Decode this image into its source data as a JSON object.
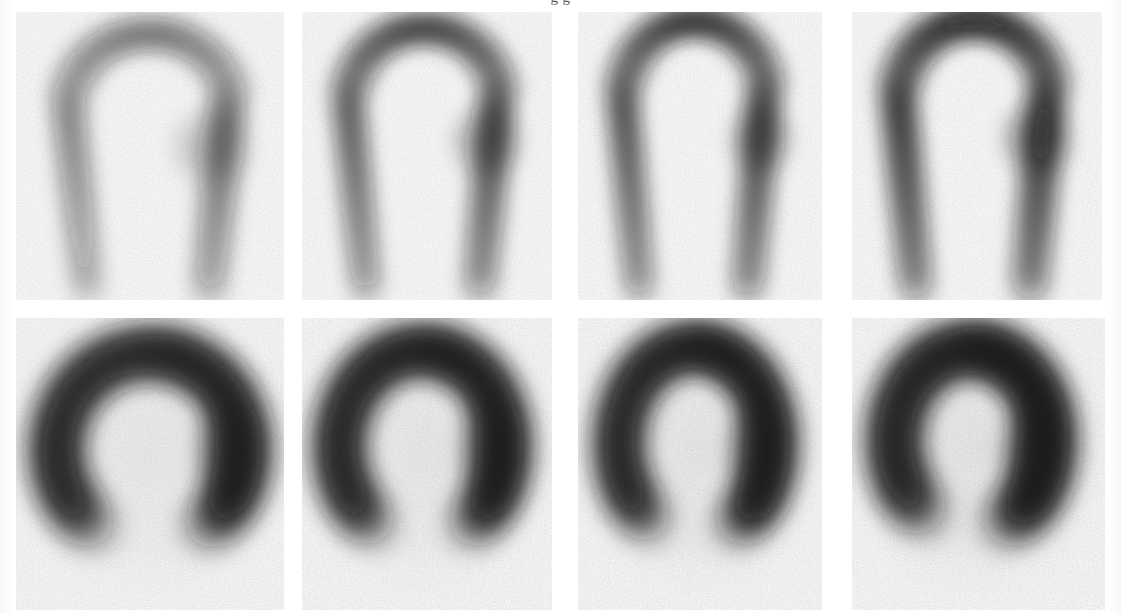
{
  "figure": {
    "domain": "medical-nuclear-imaging",
    "modality": "SPECT myocardial perfusion scintigraphy",
    "background_color": "#ffffff",
    "ink_color": "#1c1c1c",
    "clipped_caption_above_crop": "g g",
    "width": 1121,
    "height": 613,
    "rows": 2,
    "columns": 4,
    "row_labels": [
      "vertical-long-axis",
      "short-axis"
    ],
    "panels": [
      {
        "id": "panel-r1c1",
        "row": 0,
        "col": 0,
        "view": "vertical-long-axis",
        "shape": "inverted-v",
        "intensity": "faint",
        "peak_darkness": 0.42,
        "x": 16,
        "y": 12,
        "w": 268,
        "h": 288,
        "cx": 0.5,
        "cy": 0.42,
        "arc_rx": 0.205,
        "arc_ry": 0.315,
        "wall_thickness": 0.105,
        "apex_lift": 0.1,
        "tilt": -4,
        "left_wall_gain": 0.8,
        "right_wall_gain": 1.0,
        "apex_gain": 0.92,
        "base_blob": {
          "cx": 0.73,
          "cy": 0.47,
          "r": 0.17,
          "gain": 0.55
        },
        "blur": 7.0,
        "noise": 0.3
      },
      {
        "id": "panel-r1c2",
        "row": 0,
        "col": 1,
        "view": "vertical-long-axis",
        "shape": "inverted-v",
        "intensity": "moderate",
        "peak_darkness": 0.58,
        "x": 302,
        "y": 12,
        "w": 250,
        "h": 288,
        "cx": 0.49,
        "cy": 0.41,
        "arc_rx": 0.205,
        "arc_ry": 0.32,
        "wall_thickness": 0.11,
        "apex_lift": 0.11,
        "tilt": -3,
        "left_wall_gain": 0.86,
        "right_wall_gain": 1.0,
        "apex_gain": 1.0,
        "base_blob": {
          "cx": 0.74,
          "cy": 0.45,
          "r": 0.16,
          "gain": 0.62
        },
        "blur": 6.5,
        "noise": 0.3
      },
      {
        "id": "panel-r1c3",
        "row": 0,
        "col": 2,
        "view": "vertical-long-axis",
        "shape": "inverted-v",
        "intensity": "moderate-dark",
        "peak_darkness": 0.64,
        "x": 578,
        "y": 12,
        "w": 244,
        "h": 288,
        "cx": 0.48,
        "cy": 0.4,
        "arc_rx": 0.2,
        "arc_ry": 0.33,
        "wall_thickness": 0.112,
        "apex_lift": 0.12,
        "tilt": -2,
        "left_wall_gain": 0.9,
        "right_wall_gain": 0.98,
        "apex_gain": 1.0,
        "base_blob": {
          "cx": 0.75,
          "cy": 0.44,
          "r": 0.15,
          "gain": 0.6
        },
        "blur": 6.5,
        "noise": 0.3
      },
      {
        "id": "panel-r1c4",
        "row": 0,
        "col": 3,
        "view": "vertical-long-axis",
        "shape": "inverted-v",
        "intensity": "dark",
        "peak_darkness": 0.72,
        "x": 852,
        "y": 12,
        "w": 250,
        "h": 288,
        "cx": 0.49,
        "cy": 0.4,
        "arc_rx": 0.205,
        "arc_ry": 0.33,
        "wall_thickness": 0.118,
        "apex_lift": 0.12,
        "tilt": -2,
        "left_wall_gain": 0.92,
        "right_wall_gain": 0.95,
        "apex_gain": 1.0,
        "base_blob": {
          "cx": 0.74,
          "cy": 0.44,
          "r": 0.16,
          "gain": 0.66
        },
        "blur": 6.5,
        "noise": 0.3
      },
      {
        "id": "panel-r2c1",
        "row": 1,
        "col": 0,
        "view": "short-axis",
        "shape": "horseshoe-ring",
        "intensity": "dark",
        "peak_darkness": 0.8,
        "x": 16,
        "y": 318,
        "w": 268,
        "h": 292,
        "cx": 0.5,
        "cy": 0.45,
        "arc_rx": 0.19,
        "arc_ry": 0.215,
        "wall_thickness": 0.135,
        "gap_angle_deg": 90,
        "gap_width_deg": 58,
        "tilt": 0,
        "left_wall_gain": 0.88,
        "right_wall_gain": 1.0,
        "apex_gain": 0.95,
        "blur": 8.0,
        "noise": 0.34,
        "background_tint": 0.1
      },
      {
        "id": "panel-r2c2",
        "row": 1,
        "col": 1,
        "view": "short-axis",
        "shape": "horseshoe-ring",
        "intensity": "dark",
        "peak_darkness": 0.84,
        "x": 302,
        "y": 318,
        "w": 250,
        "h": 292,
        "cx": 0.48,
        "cy": 0.44,
        "arc_rx": 0.18,
        "arc_ry": 0.215,
        "wall_thickness": 0.14,
        "gap_angle_deg": 90,
        "gap_width_deg": 56,
        "tilt": 0,
        "left_wall_gain": 0.88,
        "right_wall_gain": 1.0,
        "apex_gain": 0.96,
        "blur": 8.0,
        "noise": 0.34,
        "background_tint": 0.11
      },
      {
        "id": "panel-r2c3",
        "row": 1,
        "col": 2,
        "view": "short-axis",
        "shape": "horseshoe-ring",
        "intensity": "dark",
        "peak_darkness": 0.86,
        "x": 578,
        "y": 318,
        "w": 244,
        "h": 292,
        "cx": 0.48,
        "cy": 0.43,
        "arc_rx": 0.17,
        "arc_ry": 0.215,
        "wall_thickness": 0.14,
        "gap_angle_deg": 92,
        "gap_width_deg": 54,
        "tilt": 4,
        "left_wall_gain": 0.86,
        "right_wall_gain": 1.0,
        "apex_gain": 0.96,
        "blur": 8.0,
        "noise": 0.34,
        "background_tint": 0.12
      },
      {
        "id": "panel-r2c4",
        "row": 1,
        "col": 3,
        "view": "short-axis",
        "shape": "horseshoe-ring",
        "intensity": "dark",
        "peak_darkness": 0.88,
        "x": 852,
        "y": 318,
        "w": 253,
        "h": 292,
        "cx": 0.47,
        "cy": 0.42,
        "arc_rx": 0.165,
        "arc_ry": 0.205,
        "wall_thickness": 0.145,
        "gap_angle_deg": 95,
        "gap_width_deg": 50,
        "tilt": 8,
        "left_wall_gain": 0.82,
        "right_wall_gain": 1.0,
        "apex_gain": 0.98,
        "blur": 8.0,
        "noise": 0.34,
        "background_tint": 0.13
      }
    ]
  }
}
